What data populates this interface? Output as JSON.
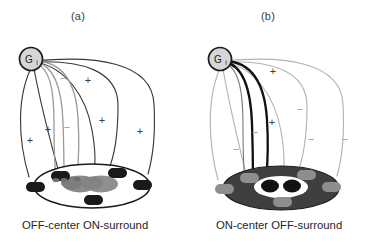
{
  "figure": {
    "width": 368,
    "height": 242,
    "background": "#ffffff"
  },
  "panels": [
    {
      "id": "a",
      "letter": "(a)",
      "caption": "OFF-center ON-surround",
      "ganglion_label": "G",
      "ganglion_sub": "i",
      "disc_fill": "#ffffff",
      "disc_stroke": "#1a1a1a",
      "center_patch_fill": "#8c8c8c",
      "surround_pad_fill": "#1a1a1a",
      "center_sign": "−",
      "surround_sign": "+",
      "center_line_color": "#9a9a9a",
      "surround_line_color": "#3a3a3a",
      "signs": [
        {
          "label": "−",
          "x": 63,
          "y": 79,
          "faint": true
        },
        {
          "label": "−",
          "x": 67,
          "y": 128,
          "faint": true
        },
        {
          "label": "+",
          "x": 88,
          "y": 81,
          "faint": false
        },
        {
          "label": "+",
          "x": 48,
          "y": 130,
          "faint": false
        },
        {
          "label": "+",
          "x": 30,
          "y": 141,
          "faint": false
        },
        {
          "label": "+",
          "x": 102,
          "y": 121,
          "faint": false
        },
        {
          "label": "+",
          "x": 140,
          "y": 132,
          "faint": false
        }
      ]
    },
    {
      "id": "b",
      "letter": "(b)",
      "caption": "ON-center OFF-surround",
      "ganglion_label": "G",
      "ganglion_sub": "i",
      "disc_fill": "#3f3f3f",
      "disc_stroke": "#1a1a1a",
      "center_patch_fill": "#ffffff",
      "center_dot_fill": "#111111",
      "surround_pad_fill": "#8e8e8e",
      "center_sign": "+",
      "surround_sign": "−",
      "center_line_color": "#111111",
      "surround_line_color": "#b0b0b0",
      "signs": [
        {
          "label": "+",
          "x": 273,
          "y": 72,
          "faint": false
        },
        {
          "label": "+",
          "x": 272,
          "y": 123,
          "faint": false
        },
        {
          "label": "−",
          "x": 300,
          "y": 110,
          "faint": true
        },
        {
          "label": "−",
          "x": 311,
          "y": 140,
          "faint": true
        },
        {
          "label": "−",
          "x": 345,
          "y": 140,
          "faint": true
        },
        {
          "label": "−",
          "x": 255,
          "y": 133,
          "faint": true
        },
        {
          "label": "−",
          "x": 236,
          "y": 150,
          "faint": true
        }
      ]
    }
  ]
}
